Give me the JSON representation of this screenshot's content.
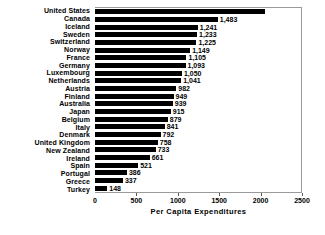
{
  "chart_data": {
    "type": "bar",
    "orientation": "horizontal",
    "title": "",
    "xlabel": "Per Capita Expenditures",
    "ylabel": "",
    "xlim": [
      0,
      2500
    ],
    "xticks": [
      0,
      500,
      1000,
      1500,
      2000,
      2500
    ],
    "xtick_labels": [
      "0",
      "500",
      "1000",
      "1500",
      "2000",
      "2500"
    ],
    "grid": false,
    "legend": null,
    "categories": [
      "United States",
      "Canada",
      "Iceland",
      "Sweden",
      "Switzerland",
      "Norway",
      "France",
      "Germany",
      "Luxembourg",
      "Netherlands",
      "Austria",
      "Finland",
      "Australia",
      "Japan",
      "Belgium",
      "Italy",
      "Denmark",
      "United Kingdom",
      "New Zealand",
      "Ireland",
      "Spain",
      "Portugal",
      "Greece",
      "Turkey"
    ],
    "values": [
      2051,
      1483,
      1241,
      1233,
      1225,
      1149,
      1105,
      1093,
      1050,
      1041,
      982,
      949,
      939,
      915,
      879,
      841,
      792,
      758,
      733,
      661,
      521,
      386,
      337,
      148
    ],
    "data_labels": [
      "$2,051",
      "1,483",
      "1,241",
      "1,233",
      "1,225",
      "1,149",
      "1,105",
      "1,093",
      "1,050",
      "1,041",
      "982",
      "949",
      "939",
      "915",
      "879",
      "841",
      "792",
      "758",
      "733",
      "661",
      "521",
      "386",
      "337",
      "148"
    ],
    "bar_color": "#000000",
    "label_inside_flags": [
      true,
      false,
      false,
      false,
      false,
      false,
      false,
      false,
      false,
      false,
      false,
      false,
      false,
      false,
      false,
      false,
      false,
      false,
      false,
      false,
      false,
      false,
      false,
      false
    ]
  }
}
